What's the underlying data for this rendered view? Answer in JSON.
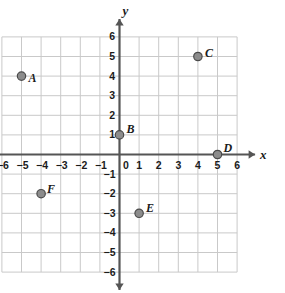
{
  "figure": {
    "type": "coordinate-plane",
    "background_color": "#ffffff",
    "grid_color": "#c9c9c9",
    "axis_color": "#555555",
    "point_fill": "#8c8c8c",
    "point_stroke": "#4a4a4a",
    "label_color": "#1b1b1b"
  },
  "axes": {
    "x": {
      "name": "x",
      "min": -6,
      "max": 6,
      "ticks": [
        "-6",
        "-5",
        "-4",
        "-3",
        "-2",
        "-1",
        "0",
        "1",
        "2",
        "3",
        "4",
        "5",
        "6"
      ],
      "arrow_both_ends": true
    },
    "y": {
      "name": "y",
      "min": -6,
      "max": 6,
      "ticks": [
        "6",
        "5",
        "4",
        "3",
        "2",
        "1",
        "-1",
        "-2",
        "-3",
        "-4",
        "-5",
        "-6"
      ],
      "arrow_both_ends": true
    }
  },
  "points": [
    {
      "label": "A",
      "x": -5,
      "y": 4,
      "label_dx": 7,
      "label_dy": -4
    },
    {
      "label": "B",
      "x": 0,
      "y": 1,
      "label_dx": 7,
      "label_dy": -12
    },
    {
      "label": "C",
      "x": 4,
      "y": 5,
      "label_dx": 7,
      "label_dy": -10
    },
    {
      "label": "D",
      "x": 5,
      "y": 0,
      "label_dx": 6,
      "label_dy": -13
    },
    {
      "label": "E",
      "x": 1,
      "y": -3,
      "label_dx": 7,
      "label_dy": -11
    },
    {
      "label": "F",
      "x": -4,
      "y": -2,
      "label_dx": 6,
      "label_dy": -11
    }
  ],
  "chart_data": {
    "type": "scatter",
    "title": "",
    "xlabel": "x",
    "ylabel": "y",
    "xlim": [
      -6,
      6
    ],
    "ylim": [
      -6,
      6
    ],
    "grid": true,
    "legend": "none",
    "series": [
      {
        "name": "plotted points",
        "points": [
          {
            "name": "A",
            "x": -5,
            "y": 4
          },
          {
            "name": "B",
            "x": 0,
            "y": 1
          },
          {
            "name": "C",
            "x": 4,
            "y": 5
          },
          {
            "name": "D",
            "x": 5,
            "y": 0
          },
          {
            "name": "E",
            "x": 1,
            "y": -3
          },
          {
            "name": "F",
            "x": -4,
            "y": -2
          }
        ]
      }
    ]
  }
}
